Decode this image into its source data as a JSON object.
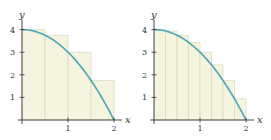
{
  "chart_data": [
    {
      "type": "bar",
      "title": "",
      "description": "Left-endpoint Riemann sum rectangles under y = 4 - x^2 on [0,2], n = 4",
      "function": "y = 4 - x^2",
      "xlabel": "x",
      "ylabel": "y",
      "xlim": [
        0,
        2
      ],
      "ylim": [
        0,
        4
      ],
      "x_ticks": [
        "1",
        "2"
      ],
      "y_ticks": [
        "1",
        "2",
        "3",
        "4"
      ],
      "rectangles": {
        "x_left": [
          0,
          0.5,
          1,
          1.5
        ],
        "width": 0.5,
        "heights": [
          4,
          3.75,
          3,
          1.75
        ]
      },
      "grid": false,
      "colors": {
        "fill": "#f5f4de",
        "stroke": "#dedcc4",
        "curve": "#4aa6b6",
        "axis": "#333333"
      }
    },
    {
      "type": "bar",
      "title": "",
      "description": "Left-endpoint Riemann sum rectangles under y = 4 - x^2 on [0,2], n = 8",
      "function": "y = 4 - x^2",
      "xlabel": "x",
      "ylabel": "y",
      "xlim": [
        0,
        2
      ],
      "ylim": [
        0,
        4
      ],
      "x_ticks": [
        "1",
        "2"
      ],
      "y_ticks": [
        "1",
        "2",
        "3",
        "4"
      ],
      "rectangles": {
        "x_left": [
          0,
          0.25,
          0.5,
          0.75,
          1,
          1.25,
          1.5,
          1.75
        ],
        "width": 0.25,
        "heights": [
          4,
          3.9375,
          3.75,
          3.4375,
          3,
          2.4375,
          1.75,
          0.9375
        ]
      },
      "grid": false,
      "colors": {
        "fill": "#f5f4de",
        "stroke": "#dedcc4",
        "curve": "#4aa6b6",
        "axis": "#333333"
      }
    }
  ],
  "labels": {
    "x": "x",
    "y": "y",
    "ticks_x": [
      "1",
      "2"
    ],
    "ticks_y": [
      "1",
      "2",
      "3",
      "4"
    ]
  }
}
